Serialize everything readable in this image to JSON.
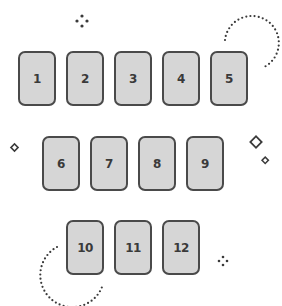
{
  "cards": [
    {
      "label": "1"
    },
    {
      "label": "2"
    },
    {
      "label": "3"
    },
    {
      "label": "4"
    },
    {
      "label": "5"
    },
    {
      "label": "6"
    },
    {
      "label": "7"
    },
    {
      "label": "8"
    },
    {
      "label": "9"
    },
    {
      "label": "10"
    },
    {
      "label": "11"
    },
    {
      "label": "12"
    }
  ],
  "colors": {
    "card_fill": "#d6d6d6",
    "card_border": "#4a4a4a",
    "decoration": "#3a3a3a"
  }
}
